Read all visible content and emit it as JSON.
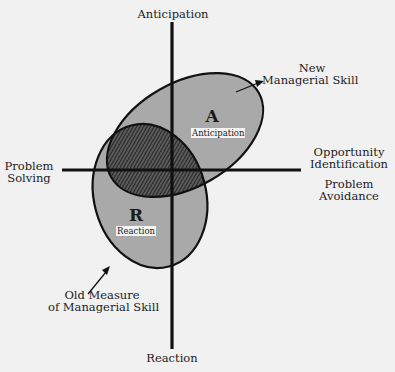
{
  "diagram": {
    "axes": {
      "top": "Anticipation",
      "bottom": "Reaction",
      "left": [
        "Problem",
        "Solving"
      ],
      "right_upper": [
        "Opportunity",
        "Identification"
      ],
      "right_lower": [
        "Problem",
        "Avoidance"
      ]
    },
    "regions": {
      "anticipation": {
        "letter": "A",
        "tag": "Anticipation"
      },
      "reaction": {
        "letter": "R",
        "tag": "Reaction"
      }
    },
    "callouts": {
      "new_skill": [
        "New",
        "Managerial Skill"
      ],
      "old_skill": [
        "Old Measure",
        "of Managerial Skill"
      ]
    },
    "colors": {
      "background": "#f1f1f1",
      "ellipse_fill": "#a9a9a9",
      "overlap_fill": "#3a3a3a",
      "stroke": "#111111"
    }
  }
}
